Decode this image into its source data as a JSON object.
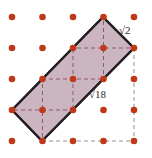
{
  "figure": {
    "canvas": {
      "width": 152,
      "height": 158,
      "background": "#ffffff"
    },
    "lattice": {
      "rows": 5,
      "cols": 5,
      "origin_x": 12,
      "origin_y": 17,
      "spacing_x": 30.5,
      "spacing_y": 31,
      "dot_radius": 3.2,
      "dot_color": "#c0381a",
      "dot_color_inner": "#d8472a"
    },
    "shape": {
      "name": "parallelogram",
      "fill_color": "#c8b1bd",
      "fill_opacity": 0.95,
      "stroke_color": "#231f20",
      "stroke_width": 2.2,
      "vertices": [
        {
          "name": "top",
          "x": 103,
          "y": 17
        },
        {
          "name": "right",
          "x": 134,
          "y": 48
        },
        {
          "name": "bottom",
          "x": 42,
          "y": 141
        },
        {
          "name": "left",
          "x": 12,
          "y": 110
        }
      ]
    },
    "dashes": {
      "color": "#8c5a6b",
      "helper_color": "#8a8a8a",
      "width": 1,
      "pattern": "4 3"
    },
    "labels": [
      {
        "name": "short-side-length",
        "radical": "√",
        "radicand": "2",
        "text": "√2",
        "x": 119,
        "y": 25
      },
      {
        "name": "long-side-length",
        "radical": "√",
        "radicand": "18",
        "text": "√18",
        "x": 89,
        "y": 89
      }
    ]
  }
}
